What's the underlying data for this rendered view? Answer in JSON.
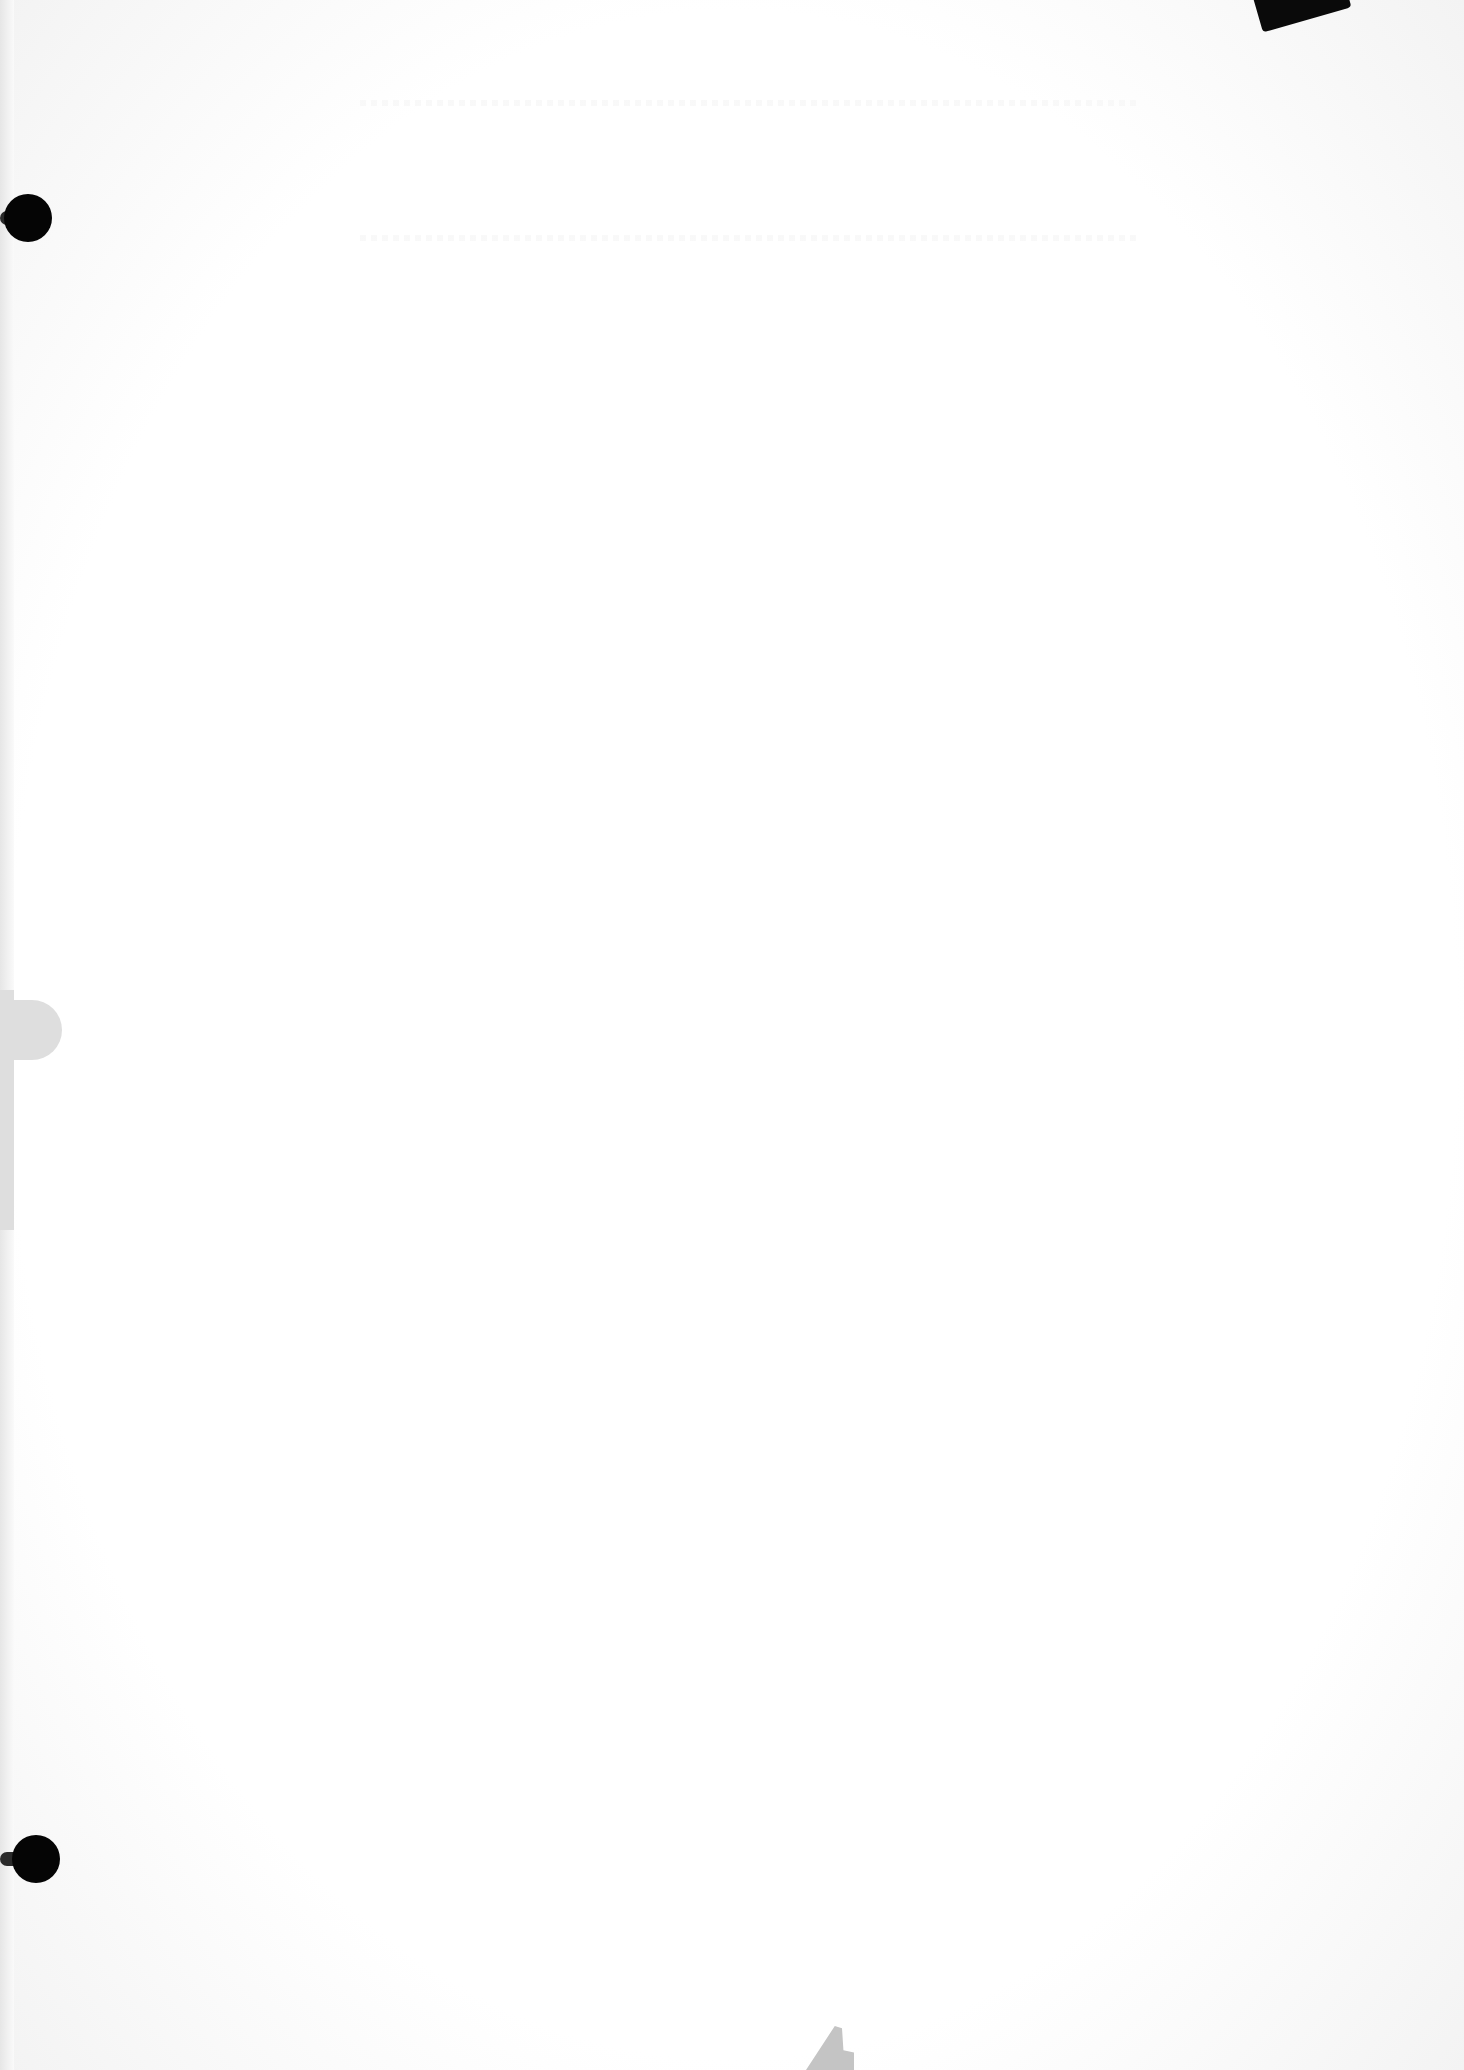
{
  "document": {
    "type": "blank scanned page",
    "text_content": "",
    "marks": [
      {
        "name": "punch-hole-top",
        "color": "#050505"
      },
      {
        "name": "punch-hole-bottom",
        "color": "#050505"
      },
      {
        "name": "corner-tab",
        "color": "#0a0a0a"
      },
      {
        "name": "binding-tab",
        "color": "#dedede"
      },
      {
        "name": "bottom-mark",
        "color": "#c4c4c4"
      }
    ],
    "background_color": "#ffffff"
  }
}
